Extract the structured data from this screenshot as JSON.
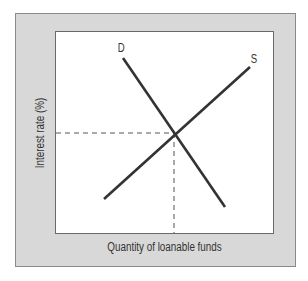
{
  "diagram": {
    "x_axis_label": "Quantity of loanable funds",
    "y_axis_label": "Interest rate (%)",
    "curves": [
      {
        "id": "demand",
        "label": "D",
        "from": [
          123,
          58
        ],
        "to": [
          225,
          207
        ]
      },
      {
        "id": "supply",
        "label": "S",
        "from": [
          104,
          199
        ],
        "to": [
          250,
          67
        ]
      }
    ],
    "equilibrium": {
      "x": 174,
      "y": 133
    },
    "colors": {
      "frame": "#d8d8d8",
      "plot": "#ffffff",
      "line": "#333333",
      "dashed": "#555555"
    }
  }
}
